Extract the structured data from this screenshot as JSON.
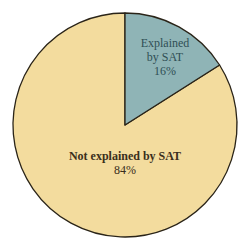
{
  "chart_data": {
    "type": "pie",
    "title": "",
    "slices": [
      {
        "label": "Explained by SAT",
        "value": 16,
        "display": "16%",
        "color": "#8fb4b6"
      },
      {
        "label": "Not explained by SAT",
        "value": 84,
        "display": "84%",
        "color": "#f3dc9e"
      }
    ],
    "start_angle": "12 o'clock",
    "direction": "clockwise",
    "legend": "none"
  },
  "labels": {
    "explained_line1": "Explained",
    "explained_line2": "by SAT",
    "explained_pct": "16%",
    "not_line1": "Not explained by SAT",
    "not_pct": "84%"
  }
}
